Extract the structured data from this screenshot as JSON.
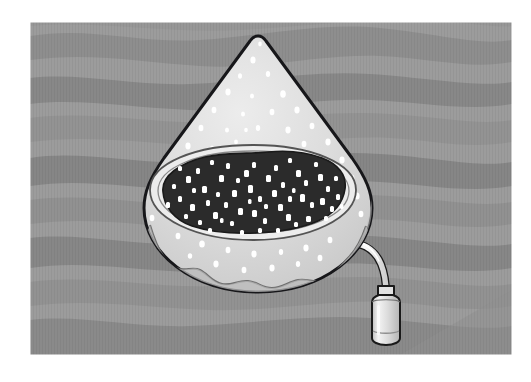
{
  "figure": {
    "caption": "",
    "medium": "halftone / stippled grayscale engraving style illustration",
    "panel": {
      "name": "illustration-panel",
      "x": 30,
      "y": 22,
      "width": 482,
      "height": 333,
      "background_light": "#9c9c9c",
      "background_dark": "#8a8a8a",
      "outer_margin_color": "#ffffff"
    },
    "palette": {
      "outline": "#1a1a1a",
      "body_fill": "#dcdcdc",
      "body_shade": "#c6c6c6",
      "rim_fill": "#e8e8e8",
      "cavity_fill": "#2b2b2b",
      "speckle": "#ffffff",
      "tube_fill": "#f0f0f0",
      "vial_fill": "#d5d5d5",
      "vial_highlight": "#f2f2f2",
      "background_light": "#9c9c9c",
      "background_mid": "#929292",
      "background_dark": "#858585"
    },
    "objects": [
      {
        "name": "teardrop-body",
        "label": "Teardrop shaped fruit body",
        "apex": [
          258,
          36
        ],
        "widest_y": 205,
        "left_x": 141,
        "right_x": 370,
        "bottom_y": 292
      },
      {
        "name": "seed-cavity",
        "label": "Dark speckled seed cavity (open face)",
        "center": [
          253,
          193
        ],
        "rx": 103,
        "ry": 50,
        "fill": "#2b2b2b",
        "speckle_count": 96
      },
      {
        "name": "cavity-rim",
        "label": "Light rim around the cavity opening"
      },
      {
        "name": "tube",
        "label": "Curved tube leading from fruit to vial",
        "start": [
          362,
          246
        ],
        "end": [
          384,
          296
        ]
      },
      {
        "name": "vial",
        "label": "Small cylindrical collection vial",
        "x": 366,
        "y": 292,
        "width": 34,
        "height": 52
      }
    ],
    "background": {
      "name": "wavy-band-background",
      "description": "Horizontal wavy alternating gray bands suggesting water or strata",
      "band_count": 9
    }
  }
}
